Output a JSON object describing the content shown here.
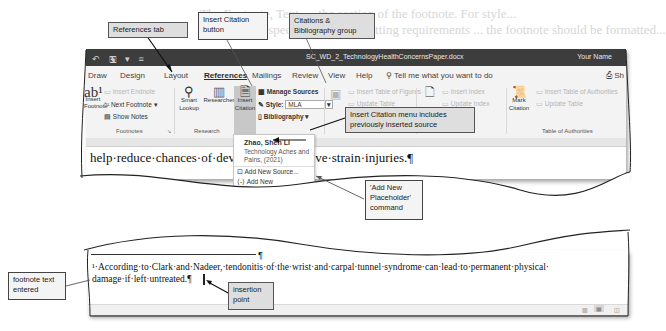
{
  "background_text": {
    "line1": "The Footnote, Text, ... the section of the footnote. For style...",
    "line2": "...that shows specific paper formatting requirements ... the footnote should be formatted..."
  },
  "window": {
    "title": "SC_WD_2_TechnologyHealthConcernsPaper.docx",
    "user": "Your Name",
    "qat_icons": [
      "undo-icon",
      "save-icon",
      "customize-icon"
    ],
    "tabs": [
      "Draw",
      "Design",
      "Layout",
      "References",
      "Mailings",
      "Review",
      "View",
      "Help"
    ],
    "active_tab": "References",
    "tell_me": "Tell me what you want to do",
    "share": "Sh"
  },
  "ribbon": {
    "footnotes": {
      "label": "Footnotes",
      "insert_footnote": "Insert Footnote",
      "insert_endnote": "Insert Endnote",
      "next_footnote": "Next Footnote",
      "show_notes": "Show Notes"
    },
    "research": {
      "label": "Research",
      "smart_lookup": "Smart Lookup",
      "researcher": "Researcher"
    },
    "citations": {
      "label": "Citations & Bibliography",
      "insert_citation": "Insert Citation",
      "manage_sources": "Manage Sources",
      "style_label": "Style:",
      "style_value": "MLA",
      "bibliography": "Bibliography"
    },
    "captions": {
      "label": "Captions",
      "insert_caption": "Insert Caption",
      "insert_table_of_figures": "Insert Table of Figures",
      "update_table": "Update Table"
    },
    "index": {
      "label": "Index",
      "mark_entry": "Mark Entry",
      "insert_index": "Insert Index",
      "update_index": "Update Index"
    },
    "authorities": {
      "label": "Table of Authorities",
      "mark_citation": "Mark Citation",
      "insert_table_of_authorities": "Insert Table of Authorities",
      "update_table": "Update Table"
    }
  },
  "citation_menu": {
    "source_author": "Zhao, Shen Li",
    "source_title": "Technology Aches and Pains, (2021)",
    "add_new_source": "Add New Source...",
    "add_new_placeholder": "Add New Placeholder..."
  },
  "document": {
    "body_line": "help·reduce·chances·of·developing·repetitive·strain·injuries.¶",
    "footnote_line1": "¹·According·to·Clark·and·Nadeer,·tendonitis·of·the·wrist·and·carpal·tunnel·syndrome·can·lead·to·permanent·physical·",
    "footnote_line2": "damage·if·left·untreated.¶"
  },
  "callouts": {
    "references_tab": "References tab",
    "insert_citation": "Insert Citation button",
    "citations_group": "Citations & Bibliography group",
    "menu_includes": "Insert Citation menu includes previously inserted source",
    "add_placeholder": "'Add New Placeholder' command",
    "footnote_text": "footnote text entered",
    "insertion_point": "insertion point"
  }
}
